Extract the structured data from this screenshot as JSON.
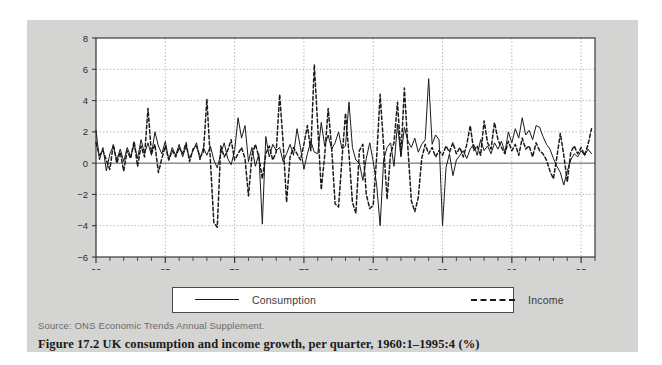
{
  "figure": {
    "caption": "Figure 17.2 UK consumption and income growth, per quarter, 1960:1–1995:4 (%)",
    "source": "Source: ONS Economic Trends Annual Supplement.",
    "panel_bg": "#d4d4d2",
    "plot_bg": "#ffffff",
    "ink": "#1a1a1a"
  },
  "legend": {
    "position": "below-axes",
    "items": [
      {
        "label": "Consumption",
        "style": "solid",
        "color": "#1a1a1a"
      },
      {
        "label": "Income",
        "style": "dashed",
        "color": "#1a1a1a"
      }
    ]
  },
  "chart_data": {
    "type": "line",
    "title": "",
    "subtitle": "",
    "xlabel": "",
    "ylabel": "",
    "xlim": [
      1960.0,
      1996.0
    ],
    "ylim": [
      -6,
      8
    ],
    "grid": true,
    "y_ticks": [
      8,
      6,
      4,
      2,
      0,
      -2,
      -4,
      -6
    ],
    "y_tick_labels": [
      "8",
      "6",
      "4",
      "2",
      "0",
      "−2",
      "−4",
      "−6"
    ],
    "x_ticks_major": [
      60,
      65,
      70,
      75,
      80,
      85,
      90,
      95
    ],
    "x_tick_labels": [
      "60",
      "65",
      "70",
      "75",
      "80",
      "85",
      "90",
      "95"
    ],
    "x_minor_step": 1,
    "x_start": 1960.0,
    "x_step": 0.25,
    "n_points": 144,
    "units": "percent growth per quarter",
    "series": [
      {
        "name": "Consumption",
        "style": "solid",
        "values": [
          2.1,
          0.2,
          1.0,
          -0.5,
          0.6,
          1.1,
          0.2,
          0.9,
          0.1,
          1.0,
          0.4,
          1.2,
          0.3,
          1.5,
          0.6,
          1.3,
          0.5,
          2.0,
          1.1,
          0.6,
          1.4,
          0.2,
          1.0,
          0.5,
          1.2,
          0.4,
          1.1,
          0.3,
          0.8,
          1.3,
          0.2,
          1.0,
          0.5,
          1.1,
          0.2,
          -0.3,
          0.6,
          1.3,
          0.3,
          -0.1,
          0.8,
          2.9,
          1.6,
          2.4,
          0.1,
          1.0,
          -0.2,
          0.6,
          -3.9,
          1.7,
          0.4,
          1.2,
          0.8,
          1.0,
          0.1,
          0.6,
          1.2,
          0.5,
          2.2,
          1.0,
          -0.4,
          0.6,
          1.4,
          0.7,
          0.6,
          2.6,
          1.1,
          1.8,
          0.9,
          1.3,
          2.0,
          0.9,
          1.1,
          3.9,
          1.0,
          0.2,
          0.0,
          -1.1,
          0.3,
          1.3,
          0.1,
          -1.4,
          -4.0,
          0.2,
          1.0,
          1.3,
          -0.2,
          2.5,
          0.4,
          2.3,
          1.4,
          1.0,
          1.6,
          0.7,
          1.2,
          1.5,
          5.4,
          1.2,
          1.8,
          1.5,
          -4.0,
          -0.3,
          0.6,
          -0.8,
          0.2,
          0.5,
          0.8,
          0.3,
          0.9,
          1.2,
          0.5,
          1.5,
          0.8,
          1.1,
          0.6,
          1.3,
          0.9,
          1.4,
          0.7,
          2.0,
          1.3,
          2.2,
          1.6,
          2.9,
          1.8,
          2.1,
          1.5,
          2.4,
          2.3,
          1.7,
          1.2,
          0.9,
          0.3,
          -0.2,
          -0.6,
          -1.4,
          -0.5,
          0.2,
          0.6,
          0.4,
          0.8,
          0.5,
          0.9,
          0.6
        ]
      },
      {
        "name": "Income",
        "style": "dashed",
        "values": [
          1.3,
          0.5,
          0.8,
          0.2,
          -0.4,
          1.2,
          0.0,
          0.7,
          -0.5,
          0.8,
          0.3,
          1.4,
          -0.2,
          1.1,
          0.4,
          3.5,
          0.6,
          1.2,
          -0.6,
          0.3,
          1.1,
          0.2,
          0.8,
          0.4,
          1.0,
          0.6,
          1.3,
          0.1,
          0.9,
          1.1,
          0.4,
          0.7,
          4.1,
          0.2,
          -3.8,
          -4.1,
          1.1,
          0.4,
          0.8,
          1.5,
          0.2,
          0.6,
          1.0,
          0.3,
          -2.1,
          0.5,
          1.2,
          0.4,
          -1.0,
          0.6,
          1.1,
          0.2,
          0.7,
          4.4,
          1.3,
          -2.5,
          0.4,
          1.0,
          0.6,
          0.2,
          1.2,
          2.4,
          0.8,
          6.3,
          2.3,
          -1.7,
          0.5,
          3.5,
          1.0,
          -2.6,
          -2.8,
          0.3,
          3.2,
          0.6,
          -2.5,
          -3.2,
          0.8,
          1.2,
          -2.0,
          -2.9,
          -2.7,
          0.4,
          4.4,
          1.1,
          -2.3,
          0.6,
          1.3,
          3.9,
          0.5,
          4.8,
          1.0,
          -2.4,
          -3.1,
          -2.2,
          0.3,
          1.2,
          0.6,
          1.0,
          0.4,
          0.8,
          0.5,
          1.1,
          0.7,
          1.3,
          0.6,
          1.0,
          0.4,
          1.2,
          2.4,
          0.8,
          1.1,
          0.5,
          2.7,
          1.3,
          0.9,
          2.6,
          1.5,
          1.0,
          0.6,
          1.4,
          0.8,
          1.2,
          0.5,
          1.6,
          0.9,
          1.1,
          0.4,
          1.3,
          0.8,
          0.6,
          0.2,
          -0.5,
          -1.0,
          0.4,
          1.9,
          0.5,
          -1.2,
          0.7,
          1.1,
          0.6,
          1.0,
          0.5,
          1.2,
          2.2
        ]
      }
    ]
  }
}
